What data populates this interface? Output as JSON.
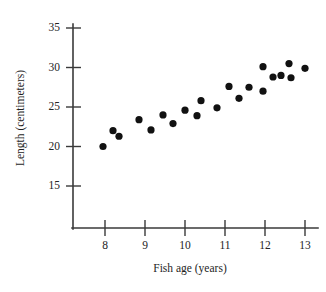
{
  "chart_data": {
    "type": "scatter",
    "title": "",
    "xlabel": "Fish age (years)",
    "ylabel": "Length (centimeters)",
    "xlim": [
      7.6,
      13.4
    ],
    "ylim": [
      13.0,
      36.0
    ],
    "xticks": [
      8,
      9,
      10,
      11,
      12,
      13
    ],
    "yticks": [
      15,
      20,
      25,
      30,
      35
    ],
    "xtick_labels": [
      "8",
      "9",
      "10",
      "11",
      "12",
      "13"
    ],
    "ytick_labels": [
      "15",
      "20",
      "25",
      "30",
      "35"
    ],
    "grid": false,
    "legend": "none",
    "marker": "filled-circle",
    "marker_color": "#111111",
    "axis_color": "#3a3a3a",
    "points": [
      {
        "x": 7.95,
        "y": 20.0
      },
      {
        "x": 8.2,
        "y": 22.0
      },
      {
        "x": 8.35,
        "y": 21.3
      },
      {
        "x": 8.85,
        "y": 23.4
      },
      {
        "x": 9.15,
        "y": 22.1
      },
      {
        "x": 9.45,
        "y": 24.0
      },
      {
        "x": 9.7,
        "y": 22.9
      },
      {
        "x": 10.0,
        "y": 24.6
      },
      {
        "x": 10.3,
        "y": 23.9
      },
      {
        "x": 10.4,
        "y": 25.8
      },
      {
        "x": 10.8,
        "y": 24.9
      },
      {
        "x": 11.1,
        "y": 27.6
      },
      {
        "x": 11.35,
        "y": 26.1
      },
      {
        "x": 11.6,
        "y": 27.5
      },
      {
        "x": 11.95,
        "y": 27.0
      },
      {
        "x": 11.95,
        "y": 30.1
      },
      {
        "x": 12.2,
        "y": 28.8
      },
      {
        "x": 12.4,
        "y": 29.0
      },
      {
        "x": 12.6,
        "y": 30.5
      },
      {
        "x": 12.65,
        "y": 28.7
      },
      {
        "x": 13.0,
        "y": 29.9
      }
    ]
  },
  "figure": {
    "xlabel": "Fish age (years)",
    "ylabel": "Length (centimeters)"
  }
}
